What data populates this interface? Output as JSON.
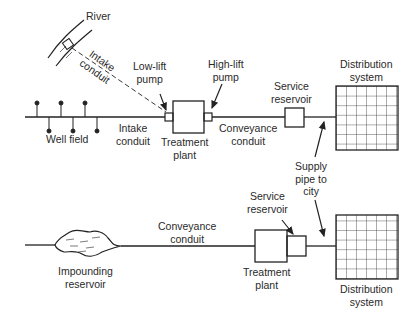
{
  "diagram": {
    "type": "water supply system schematic",
    "top_system": {
      "labels": {
        "river": "River",
        "intake_conduit_diagonal": "Intake\nconduit",
        "low_lift_pump": "Low-lift\npump",
        "high_lift_pump": "High-lift\npump",
        "well_field": "Well field",
        "intake_conduit": "Intake\nconduit",
        "treatment_plant": "Treatment\nplant",
        "conveyance_conduit": "Conveyance\nconduit",
        "service_reservoir": "Service\nreservoir",
        "distribution_system": "Distribution\nsystem"
      }
    },
    "shared": {
      "supply_pipe": "Supply\npipe to\ncity"
    },
    "bottom_system": {
      "labels": {
        "impounding_reservoir": "Impounding\nreservoir",
        "conveyance_conduit": "Conveyance\nconduit",
        "service_reservoir": "Service\nreservoir",
        "treatment_plant": "Treatment\nplant",
        "distribution_system": "Distribution\nsystem"
      }
    },
    "colors": {
      "line": "#222222",
      "text": "#2a2a2a",
      "background": "#ffffff"
    }
  }
}
